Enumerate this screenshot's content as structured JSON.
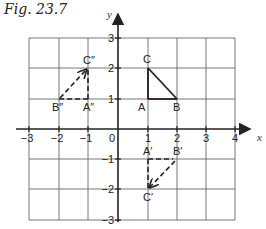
{
  "figure": {
    "title": "Fig. 23.7"
  },
  "axes": {
    "x_label": "x",
    "y_label": "y",
    "x_ticks": [
      "−3",
      "−2",
      "−1",
      "0",
      "1",
      "2",
      "3",
      "4"
    ],
    "y_ticks": [
      "3",
      "2",
      "1",
      "−1",
      "−2",
      "−3"
    ],
    "x_range": [
      -3,
      4
    ],
    "y_range": [
      -3,
      3
    ],
    "grid": true
  },
  "shapes": {
    "original": {
      "style": "solid",
      "labels": {
        "A": "A",
        "B": "B",
        "C": "C"
      },
      "points": {
        "A": [
          1,
          1
        ],
        "B": [
          2,
          1
        ],
        "C": [
          1,
          2
        ]
      }
    },
    "image1": {
      "style": "dashed",
      "labels": {
        "A": "A′",
        "B": "B′",
        "C": "C′"
      },
      "points": {
        "A": [
          1,
          -1
        ],
        "B": [
          2,
          -1
        ],
        "C": [
          1,
          -2
        ]
      }
    },
    "image2": {
      "style": "dashed",
      "labels": {
        "A": "A″",
        "B": "B″",
        "C": "C″"
      },
      "points": {
        "A": [
          -1,
          1
        ],
        "B": [
          -2,
          1
        ],
        "C": [
          -1,
          2
        ]
      }
    }
  },
  "colors": {
    "grid": "#555555",
    "axis": "#222222",
    "shape": "#222222"
  }
}
